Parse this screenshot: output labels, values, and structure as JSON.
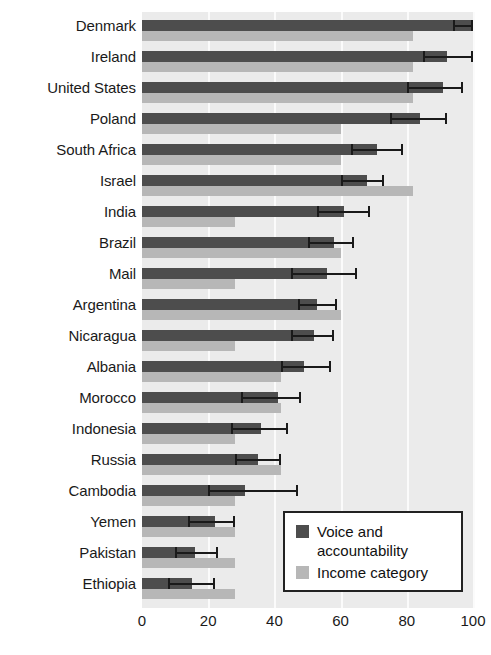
{
  "chart_data": {
    "type": "bar",
    "orientation": "horizontal",
    "title": "",
    "subtitle": "",
    "xlabel": "",
    "ylabel": "",
    "xlim": [
      0,
      100
    ],
    "xticks": [
      0,
      20,
      40,
      60,
      80,
      100
    ],
    "xtick_labels": [
      "0",
      "20",
      "40",
      "60",
      "80",
      "100"
    ],
    "grid": true,
    "grid_axis": "x",
    "legend_position": "bottom-right",
    "categories": [
      "Denmark",
      "Ireland",
      "United States",
      "Poland",
      "South Africa",
      "Israel",
      "India",
      "Brazil",
      "Mail",
      "Argentina",
      "Nicaragua",
      "Albania",
      "Morocco",
      "Indonesia",
      "Russia",
      "Cambodia",
      "Yemen",
      "Pakistan",
      "Ethiopia"
    ],
    "series": [
      {
        "name": "Voice and accountability",
        "color": "#4d4d4d",
        "values": [
          100,
          92,
          91,
          84,
          71,
          68,
          61,
          58,
          56,
          53,
          52,
          49,
          41,
          36,
          35,
          31,
          22,
          16,
          15
        ],
        "error_low": [
          94,
          85,
          80,
          75,
          63,
          60,
          53,
          50,
          45,
          47,
          45,
          42,
          30,
          27,
          28,
          20,
          14,
          10,
          8
        ],
        "error_high": [
          100,
          100,
          97,
          92,
          79,
          73,
          69,
          64,
          65,
          59,
          58,
          57,
          48,
          44,
          42,
          47,
          28,
          23,
          22
        ]
      },
      {
        "name": "Income category",
        "color": "#b7b7b7",
        "values": [
          82,
          82,
          82,
          60,
          60,
          82,
          28,
          60,
          28,
          60,
          28,
          42,
          42,
          28,
          42,
          28,
          28,
          28,
          28
        ]
      }
    ]
  },
  "legend": {
    "items": [
      {
        "label": "Voice and accountability",
        "color": "#4d4d4d",
        "swatch_name": "legend-swatch-voice"
      },
      {
        "label": "Income category",
        "color": "#b7b7b7",
        "swatch_name": "legend-swatch-income"
      }
    ]
  },
  "colors": {
    "voice": "#4d4d4d",
    "income": "#b7b7b7",
    "plot_background": "#ebebeb",
    "gridline": "#fbfbfb",
    "error_bar": "#1a1a1a",
    "text": "#1a1a1a"
  }
}
